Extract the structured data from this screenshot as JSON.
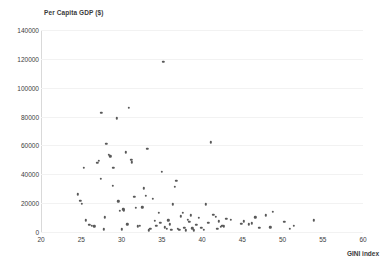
{
  "chart_data": {
    "type": "scatter",
    "title": "",
    "xlabel": "GINI index",
    "ylabel": "Per Capita GDP ($)",
    "xlim": [
      20,
      60
    ],
    "ylim": [
      0,
      140000
    ],
    "xticks": [
      20,
      25,
      30,
      35,
      40,
      45,
      50,
      55,
      60
    ],
    "yticks": [
      0,
      20000,
      40000,
      60000,
      80000,
      100000,
      120000,
      140000
    ],
    "grid": true,
    "legend": null,
    "marker_color": "#595959",
    "gridline_color": "#f2f2f2",
    "axis_color": "#d9d9d9",
    "series": [
      {
        "name": "Countries",
        "points": [
          [
            24.6,
            26200
          ],
          [
            24.9,
            21700
          ],
          [
            25.1,
            19400
          ],
          [
            25.3,
            44300
          ],
          [
            25.6,
            8100
          ],
          [
            26.0,
            5100
          ],
          [
            26.3,
            4300
          ],
          [
            26.6,
            4000
          ],
          [
            27.0,
            47800
          ],
          [
            27.2,
            49500
          ],
          [
            27.4,
            36800
          ],
          [
            27.5,
            82600
          ],
          [
            27.8,
            2000
          ],
          [
            27.9,
            10300
          ],
          [
            28.1,
            61300
          ],
          [
            28.4,
            53300
          ],
          [
            28.6,
            52400
          ],
          [
            28.9,
            32000
          ],
          [
            29.0,
            44500
          ],
          [
            29.4,
            78900
          ],
          [
            29.6,
            21300
          ],
          [
            29.8,
            14800
          ],
          [
            30.0,
            1900
          ],
          [
            30.2,
            15600
          ],
          [
            30.3,
            15100
          ],
          [
            30.5,
            55200
          ],
          [
            30.7,
            5400
          ],
          [
            30.9,
            86100
          ],
          [
            31.2,
            50100
          ],
          [
            31.3,
            48200
          ],
          [
            31.6,
            24600
          ],
          [
            31.8,
            16900
          ],
          [
            32.0,
            3900
          ],
          [
            32.3,
            4200
          ],
          [
            32.6,
            17200
          ],
          [
            32.8,
            30200
          ],
          [
            33.0,
            25000
          ],
          [
            33.2,
            57600
          ],
          [
            33.4,
            1300
          ],
          [
            33.6,
            2400
          ],
          [
            33.9,
            22900
          ],
          [
            34.1,
            7700
          ],
          [
            34.3,
            4300
          ],
          [
            34.6,
            13100
          ],
          [
            34.8,
            6200
          ],
          [
            35.0,
            41800
          ],
          [
            35.2,
            117800
          ],
          [
            35.4,
            3200
          ],
          [
            35.6,
            2100
          ],
          [
            35.8,
            8000
          ],
          [
            36.0,
            5200
          ],
          [
            36.2,
            1700
          ],
          [
            36.4,
            19300
          ],
          [
            36.6,
            31200
          ],
          [
            36.8,
            35600
          ],
          [
            37.0,
            2300
          ],
          [
            37.2,
            1500
          ],
          [
            37.4,
            10800
          ],
          [
            37.6,
            13200
          ],
          [
            37.8,
            3000
          ],
          [
            38.0,
            1100
          ],
          [
            38.2,
            8600
          ],
          [
            38.4,
            6900
          ],
          [
            38.6,
            11500
          ],
          [
            38.8,
            2600
          ],
          [
            39.0,
            1200
          ],
          [
            39.3,
            4800
          ],
          [
            39.6,
            9700
          ],
          [
            39.9,
            2800
          ],
          [
            40.2,
            1400
          ],
          [
            40.5,
            19100
          ],
          [
            40.8,
            6500
          ],
          [
            41.1,
            62100
          ],
          [
            41.4,
            11800
          ],
          [
            41.7,
            10400
          ],
          [
            41.9,
            2100
          ],
          [
            42.1,
            7300
          ],
          [
            42.3,
            3800
          ],
          [
            42.5,
            4100
          ],
          [
            42.7,
            4000
          ],
          [
            43.0,
            9000
          ],
          [
            43.6,
            8400
          ],
          [
            44.9,
            5600
          ],
          [
            45.2,
            7400
          ],
          [
            45.8,
            5400
          ],
          [
            46.2,
            5900
          ],
          [
            46.6,
            10100
          ],
          [
            47.1,
            2700
          ],
          [
            47.9,
            11600
          ],
          [
            48.5,
            3300
          ],
          [
            48.8,
            14100
          ],
          [
            50.2,
            7100
          ],
          [
            50.9,
            2400
          ],
          [
            51.4,
            4200
          ],
          [
            53.9,
            8200
          ]
        ]
      }
    ]
  }
}
